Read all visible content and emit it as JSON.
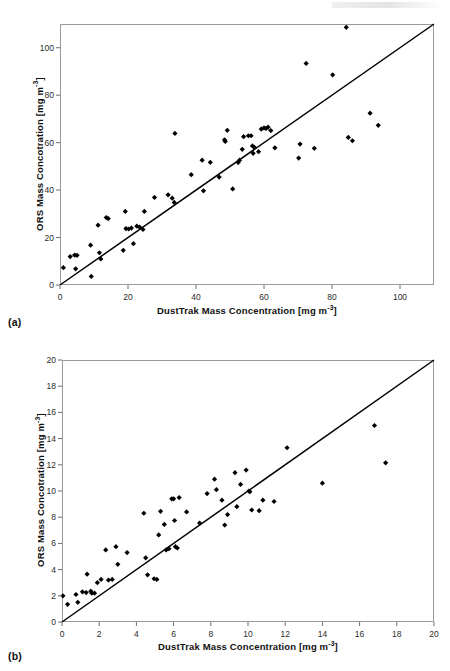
{
  "figure": {
    "panel_a_tag": "(a)",
    "panel_b_tag": "(b)"
  },
  "chart_data": [
    {
      "panel": "(a)",
      "type": "scatter",
      "title": "",
      "xlabel": "DustTrak Mass Concentration [mg m-3]",
      "xlabel_base": "DustTrak Mass Concentration [mg m",
      "xlabel_sup": "-3",
      "xlabel_tail": "]",
      "ylabel": "ORS Mass Concotration [mg m-3]",
      "ylabel_base": "ORS Mass Concotration [mg m",
      "ylabel_sup": "-3",
      "ylabel_tail": "]",
      "xlim": [
        0,
        110
      ],
      "ylim": [
        0,
        110
      ],
      "xticks": [
        0,
        20,
        40,
        60,
        80,
        100
      ],
      "yticks": [
        0,
        20,
        40,
        60,
        80,
        100
      ],
      "xticklabels": [
        "0",
        "20",
        "40",
        "60",
        "80",
        "100"
      ],
      "yticklabels": [
        "0",
        "20",
        "40",
        "60",
        "80",
        "100"
      ],
      "grid": false,
      "legend": "none",
      "reference_line": {
        "name": "1:1 identity line",
        "from": [
          0,
          0
        ],
        "to": [
          110,
          110
        ]
      },
      "points": [
        [
          1.0,
          7.3
        ],
        [
          3.0,
          12.0
        ],
        [
          4.3,
          12.6
        ],
        [
          5.0,
          12.5
        ],
        [
          4.6,
          6.8
        ],
        [
          9.0,
          16.8
        ],
        [
          9.2,
          3.6
        ],
        [
          11.2,
          25.2
        ],
        [
          11.6,
          13.6
        ],
        [
          12.0,
          11.0
        ],
        [
          13.6,
          28.4
        ],
        [
          14.2,
          28.0
        ],
        [
          18.6,
          14.6
        ],
        [
          19.2,
          31.0
        ],
        [
          19.4,
          23.8
        ],
        [
          20.2,
          23.6
        ],
        [
          21.0,
          24.0
        ],
        [
          21.6,
          17.4
        ],
        [
          22.6,
          24.8
        ],
        [
          23.4,
          24.4
        ],
        [
          24.4,
          23.4
        ],
        [
          24.8,
          31.0
        ],
        [
          27.8,
          36.9
        ],
        [
          31.8,
          38.0
        ],
        [
          33.0,
          36.6
        ],
        [
          33.6,
          34.8
        ],
        [
          33.8,
          63.9
        ],
        [
          38.6,
          46.5
        ],
        [
          41.8,
          52.6
        ],
        [
          42.2,
          39.7
        ],
        [
          44.2,
          51.7
        ],
        [
          46.8,
          45.5
        ],
        [
          48.4,
          61.2
        ],
        [
          48.6,
          60.5
        ],
        [
          49.2,
          65.2
        ],
        [
          50.8,
          40.5
        ],
        [
          52.4,
          51.6
        ],
        [
          52.8,
          52.6
        ],
        [
          53.6,
          57.2
        ],
        [
          54.0,
          62.5
        ],
        [
          55.4,
          62.9
        ],
        [
          56.2,
          62.9
        ],
        [
          56.6,
          58.6
        ],
        [
          56.8,
          55.5
        ],
        [
          57.2,
          58.0
        ],
        [
          58.4,
          56.2
        ],
        [
          59.2,
          65.7
        ],
        [
          60.0,
          66.2
        ],
        [
          60.6,
          66.0
        ],
        [
          61.2,
          66.5
        ],
        [
          62.0,
          65.1
        ],
        [
          63.2,
          57.8
        ],
        [
          70.2,
          53.5
        ],
        [
          70.6,
          59.4
        ],
        [
          72.4,
          93.4
        ],
        [
          74.8,
          57.6
        ],
        [
          80.2,
          88.6
        ],
        [
          84.2,
          108.6
        ],
        [
          84.8,
          62.2
        ],
        [
          86.0,
          60.8
        ],
        [
          91.2,
          72.4
        ],
        [
          93.6,
          67.3
        ]
      ]
    },
    {
      "panel": "(b)",
      "type": "scatter",
      "title": "",
      "xlabel": "DustTrak Mass Concentration [mg m-3]",
      "xlabel_base": "DustTrak Mass Concentration [mg m",
      "xlabel_sup": "-3",
      "xlabel_tail": "]",
      "ylabel": "ORS Mass Concotration [mg m-3]",
      "ylabel_base": "ORS Mass Concotration [mg m",
      "ylabel_sup": "-3",
      "ylabel_tail": "]",
      "xlim": [
        0,
        20
      ],
      "ylim": [
        0,
        20
      ],
      "xticks": [
        0,
        2,
        4,
        6,
        8,
        10,
        12,
        14,
        16,
        18,
        20
      ],
      "yticks": [
        0,
        2,
        4,
        6,
        8,
        10,
        12,
        14,
        16,
        18,
        20
      ],
      "xticklabels": [
        "0",
        "2",
        "4",
        "6",
        "8",
        "10",
        "12",
        "14",
        "16",
        "18",
        "20"
      ],
      "yticklabels": [
        "0",
        "2",
        "4",
        "6",
        "8",
        "10",
        "12",
        "14",
        "16",
        "18",
        "20"
      ],
      "grid": false,
      "legend": "none",
      "reference_line": {
        "name": "1:1 identity line",
        "from": [
          0,
          0
        ],
        "to": [
          20,
          20
        ]
      },
      "points": [
        [
          0.05,
          2.0
        ],
        [
          0.3,
          1.35
        ],
        [
          0.75,
          2.1
        ],
        [
          0.85,
          1.5
        ],
        [
          1.1,
          2.3
        ],
        [
          1.3,
          2.25
        ],
        [
          1.35,
          3.65
        ],
        [
          1.55,
          2.35
        ],
        [
          1.6,
          2.2
        ],
        [
          1.75,
          2.2
        ],
        [
          1.9,
          3.0
        ],
        [
          2.1,
          3.25
        ],
        [
          2.35,
          5.5
        ],
        [
          2.5,
          3.2
        ],
        [
          2.7,
          3.25
        ],
        [
          2.9,
          5.75
        ],
        [
          3.0,
          4.4
        ],
        [
          3.5,
          5.3
        ],
        [
          4.4,
          8.3
        ],
        [
          4.5,
          4.9
        ],
        [
          4.6,
          3.6
        ],
        [
          4.95,
          3.3
        ],
        [
          5.1,
          3.25
        ],
        [
          5.2,
          6.65
        ],
        [
          5.3,
          8.45
        ],
        [
          5.5,
          7.45
        ],
        [
          5.6,
          5.5
        ],
        [
          5.75,
          5.6
        ],
        [
          5.9,
          9.4
        ],
        [
          6.0,
          9.4
        ],
        [
          6.05,
          7.75
        ],
        [
          6.1,
          5.75
        ],
        [
          6.2,
          5.65
        ],
        [
          6.3,
          9.5
        ],
        [
          6.7,
          8.4
        ],
        [
          7.4,
          7.55
        ],
        [
          7.8,
          9.8
        ],
        [
          8.2,
          10.9
        ],
        [
          8.3,
          10.1
        ],
        [
          8.6,
          9.3
        ],
        [
          8.75,
          7.4
        ],
        [
          8.9,
          8.2
        ],
        [
          9.3,
          11.4
        ],
        [
          9.4,
          8.8
        ],
        [
          9.6,
          10.5
        ],
        [
          9.9,
          11.6
        ],
        [
          10.05,
          10.0
        ],
        [
          10.1,
          9.95
        ],
        [
          10.2,
          8.55
        ],
        [
          10.6,
          8.5
        ],
        [
          10.8,
          9.3
        ],
        [
          11.4,
          9.2
        ],
        [
          12.1,
          13.3
        ],
        [
          14.0,
          10.6
        ],
        [
          16.8,
          15.0
        ],
        [
          17.4,
          12.15
        ]
      ]
    }
  ]
}
